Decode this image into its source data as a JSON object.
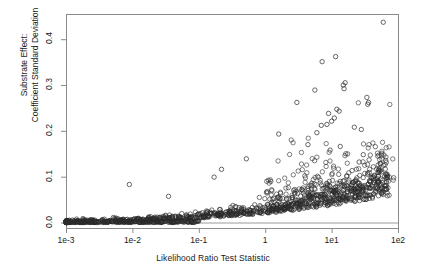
{
  "chart_data": {
    "type": "scatter",
    "title": "",
    "xlabel": "Likelihood Ratio Test Statistic",
    "ylabel_lines": [
      "Substrate Effect:",
      "Coefficient Standard Deviation"
    ],
    "xscale": "log",
    "yscale": "linear",
    "xlim": [
      0.001,
      100
    ],
    "ylim": [
      -0.012,
      0.455
    ],
    "xticks": [
      0.001,
      0.01,
      0.1,
      1,
      10,
      100
    ],
    "xticklabels": [
      "1e-3",
      "1e-2",
      "1e-1",
      "1",
      "1e1",
      "1e2"
    ],
    "yticks": [
      0.0,
      0.1,
      0.2,
      0.3,
      0.4
    ],
    "yticklabels": [
      "0.0",
      "0.1",
      "0.2",
      "0.3",
      "0.4"
    ],
    "grid": false,
    "legend": null,
    "marker": "open-circle",
    "marker_size": 3.4,
    "marker_color": "#2b2b2b",
    "frame_color": "#8a8a8a",
    "reference_line": {
      "y": 0.0,
      "color": "#9a9a9a",
      "orientation": "horizontal"
    },
    "n_points": 1400,
    "notable_points": [
      {
        "x": 60.0,
        "y": 0.437
      },
      {
        "x": 11.5,
        "y": 0.362
      },
      {
        "x": 7.2,
        "y": 0.351
      },
      {
        "x": 16.0,
        "y": 0.305
      },
      {
        "x": 15.0,
        "y": 0.3
      },
      {
        "x": 15.4,
        "y": 0.292
      },
      {
        "x": 5.6,
        "y": 0.289
      },
      {
        "x": 34.0,
        "y": 0.273
      },
      {
        "x": 36.0,
        "y": 0.262
      },
      {
        "x": 35.0,
        "y": 0.258
      },
      {
        "x": 3.0,
        "y": 0.262
      },
      {
        "x": 12.0,
        "y": 0.247
      },
      {
        "x": 13.0,
        "y": 0.243
      },
      {
        "x": 9.0,
        "y": 0.238
      },
      {
        "x": 11.0,
        "y": 0.228
      },
      {
        "x": 10.0,
        "y": 0.221
      },
      {
        "x": 8.5,
        "y": 0.214
      },
      {
        "x": 7.0,
        "y": 0.212
      },
      {
        "x": 22.0,
        "y": 0.208
      },
      {
        "x": 28.0,
        "y": 0.203
      },
      {
        "x": 6.0,
        "y": 0.196
      },
      {
        "x": 1.6,
        "y": 0.193
      },
      {
        "x": 4.4,
        "y": 0.17
      },
      {
        "x": 13.5,
        "y": 0.166
      },
      {
        "x": 9.5,
        "y": 0.158
      },
      {
        "x": 30.0,
        "y": 0.148
      },
      {
        "x": 0.52,
        "y": 0.139
      },
      {
        "x": 26.0,
        "y": 0.132
      },
      {
        "x": 0.22,
        "y": 0.116
      },
      {
        "x": 44.0,
        "y": 0.103
      },
      {
        "x": 0.17,
        "y": 0.099
      },
      {
        "x": 0.009,
        "y": 0.083
      },
      {
        "x": 20.0,
        "y": 0.081
      },
      {
        "x": 0.035,
        "y": 0.057
      }
    ]
  },
  "geometry": {
    "plot_left": 66,
    "plot_right": 398,
    "plot_top": 14,
    "plot_bottom": 228
  }
}
